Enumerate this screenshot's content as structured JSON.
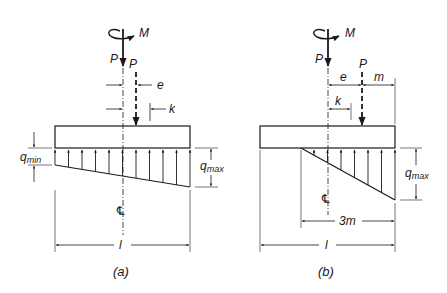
{
  "figure": {
    "colors": {
      "ink": "#1a1a1a",
      "background": "#ffffff"
    },
    "panel_a": {
      "caption": "(a)",
      "moment_label": "M",
      "load_label": "P",
      "eccentric_load_label": "P",
      "eccentricity_label": "e",
      "kern_label": "k",
      "q_min_label": "q",
      "q_min_sub": "min",
      "q_max_label": "q",
      "q_max_sub": "max",
      "centerline_label": "℄",
      "length_label": "l"
    },
    "panel_b": {
      "caption": "(b)",
      "moment_label": "M",
      "load_label": "P",
      "eccentric_load_label": "P",
      "eccentricity_label": "e",
      "edge_distance_label": "m",
      "kern_label": "k",
      "q_max_label": "q",
      "q_max_sub": "max",
      "centerline_label": "℄",
      "contact_length_label": "3m",
      "length_label": "l"
    }
  }
}
